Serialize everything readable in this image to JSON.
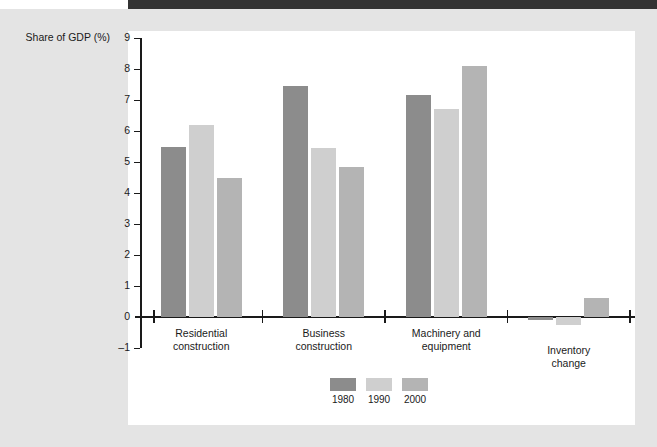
{
  "chart_data": {
    "type": "bar",
    "title": "",
    "subtitle": "",
    "xlabel": "",
    "ylabel": "Share of GDP (%)",
    "ylim": [
      -1,
      9
    ],
    "ytick_labels": [
      "9",
      "8",
      "7",
      "6",
      "5",
      "4",
      "3",
      "2",
      "1",
      "0",
      "–1"
    ],
    "ytick_values": [
      9,
      8,
      7,
      6,
      5,
      4,
      3,
      2,
      1,
      0,
      -1
    ],
    "grid": false,
    "legend_position": "bottom-center",
    "categories": [
      "Residential\nconstruction",
      "Business\nconstruction",
      "Machinery and\nequipment",
      "Inventory\nchange"
    ],
    "series": [
      {
        "name": "1980",
        "color": "#8c8c8c",
        "values": [
          5.5,
          7.45,
          7.15,
          -0.1
        ]
      },
      {
        "name": "1990",
        "color": "#cfcfcf",
        "values": [
          6.2,
          5.45,
          6.7,
          -0.25
        ]
      },
      {
        "name": "2000",
        "color": "#b4b4b4",
        "values": [
          4.5,
          4.85,
          8.1,
          0.6
        ]
      }
    ]
  },
  "axis": {
    "y_title": "Share of GDP (%)"
  },
  "legend": {
    "items": [
      {
        "label": "1980",
        "color": "#8c8c8c"
      },
      {
        "label": "1990",
        "color": "#cfcfcf"
      },
      {
        "label": "2000",
        "color": "#b4b4b4"
      }
    ]
  },
  "colors": {
    "page_background": "#e4e4e4",
    "panel_background": "#ffffff",
    "top_bar": "#333333",
    "axis": "#1a1a1a",
    "series_1980": "#8c8c8c",
    "series_1990": "#cfcfcf",
    "series_2000": "#b4b4b4"
  }
}
